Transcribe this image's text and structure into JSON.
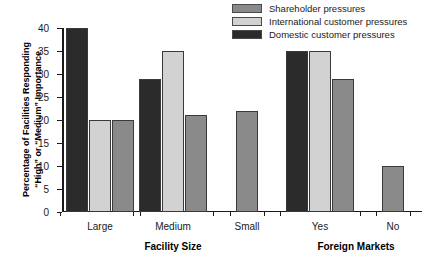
{
  "chart_data": {
    "type": "bar",
    "title": "",
    "xlabel": "",
    "ylabel": "Percentage of Facilities Responding \"High\" or \"Medium\" Importance",
    "ylim": [
      0,
      40
    ],
    "yticks": [
      0,
      5,
      10,
      15,
      20,
      25,
      30,
      35,
      40
    ],
    "grid": false,
    "legend_position": "top-right",
    "categories": [
      "Large",
      "Medium",
      "Small",
      "Yes",
      "No"
    ],
    "group_axis_titles": [
      {
        "label": "Facility Size",
        "categories": [
          "Large",
          "Medium",
          "Small"
        ]
      },
      {
        "label": "Foreign Markets",
        "categories": [
          "Yes",
          "No"
        ]
      }
    ],
    "series": [
      {
        "name": "Domestic customer pressures",
        "color": "#2b2b2b",
        "values": [
          40,
          29,
          null,
          35,
          null
        ]
      },
      {
        "name": "International customer pressures",
        "color": "#d2d2d2",
        "values": [
          20,
          35,
          null,
          35,
          null
        ]
      },
      {
        "name": "Shareholder pressures",
        "color": "#8a8a8a",
        "values": [
          20,
          21,
          22,
          29,
          10
        ]
      }
    ],
    "bar_order_in_group": [
      "Domestic customer pressures",
      "International customer pressures",
      "Shareholder pressures"
    ]
  },
  "legend": {
    "items": [
      {
        "label": "Shareholder pressures",
        "color": "#8a8a8a"
      },
      {
        "label": "International customer pressures",
        "color": "#d2d2d2"
      },
      {
        "label": "Domestic customer pressures",
        "color": "#2b2b2b"
      }
    ]
  },
  "yaxis": {
    "title_line1": "Percentage of Facilities Responding",
    "title_line2": "“High” or “Medium” Importance",
    "ticks": [
      "0",
      "5",
      "10",
      "15",
      "20",
      "25",
      "30",
      "35",
      "40"
    ]
  },
  "xaxis": {
    "groups": [
      "Large",
      "Medium",
      "Small",
      "Yes",
      "No"
    ],
    "section_titles": [
      "Facility Size",
      "Foreign Markets"
    ]
  },
  "colors": {
    "shareholder": "#8a8a8a",
    "international": "#d2d2d2",
    "domestic": "#2b2b2b",
    "axis": "#1a1a1a",
    "background": "#ffffff"
  }
}
